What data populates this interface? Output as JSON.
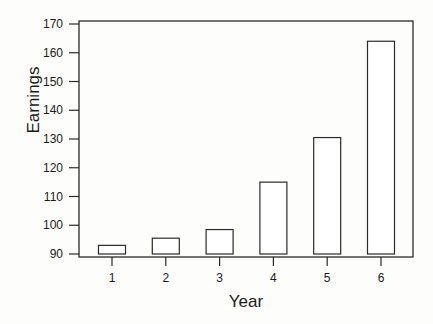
{
  "chart_data": {
    "type": "bar",
    "title": "",
    "xlabel": "Year",
    "ylabel": "Earnings",
    "categories": [
      "1",
      "2",
      "3",
      "4",
      "5",
      "6"
    ],
    "values": [
      93,
      95.5,
      98.5,
      115,
      130.5,
      164
    ],
    "baseline": 90,
    "ylim": [
      88,
      171
    ],
    "yticks": [
      90,
      100,
      110,
      120,
      130,
      140,
      150,
      160,
      170
    ],
    "grid": false,
    "legend": null,
    "bar_fill": "#ffffff",
    "bar_stroke": "#2a2a2a"
  }
}
